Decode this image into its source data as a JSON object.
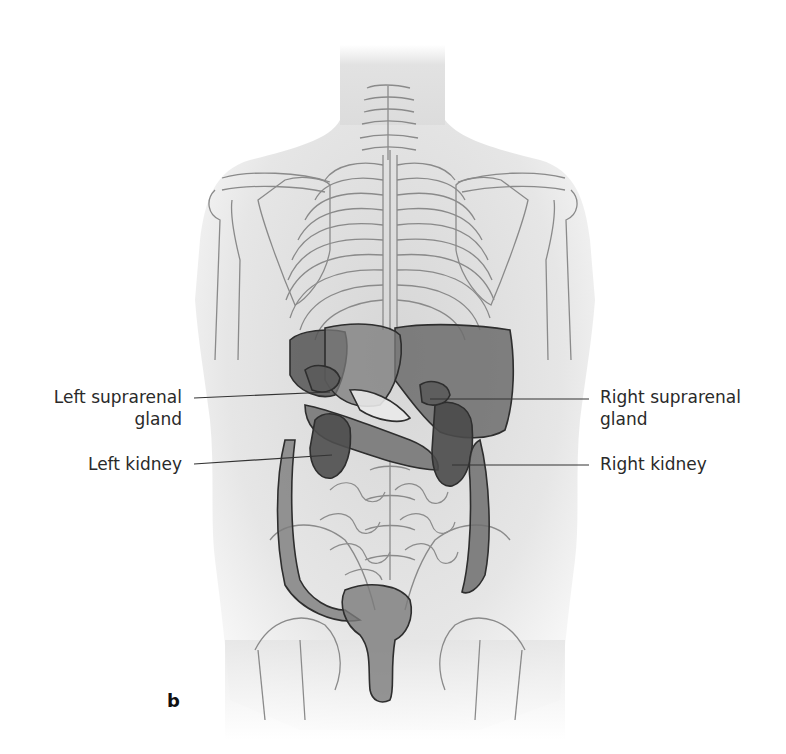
{
  "figure": {
    "panel_letter": "b",
    "labels": {
      "left_suprarenal_line1": "Left suprarenal",
      "left_suprarenal_line2": "gland",
      "left_kidney": "Left kidney",
      "right_suprarenal_line1": "Right suprarenal",
      "right_suprarenal_line2": "gland",
      "right_kidney": "Right kidney"
    },
    "colors": {
      "skin": "#e9e9e9",
      "bone_outline": "#7a7a7a",
      "organ_dark": "#5a5a5a",
      "organ_mid": "#7c7c7c",
      "organ_outline": "#2e2e2e",
      "leader_line": "#333333",
      "text": "#2a2a2a"
    }
  }
}
